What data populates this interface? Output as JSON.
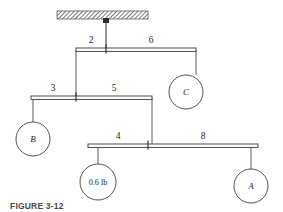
{
  "figure": {
    "caption": "FIGURE 3-12",
    "colors": {
      "line": "#4a4a4a",
      "bar_stroke": "#3a3a3a",
      "text": "#262626",
      "hatch": "#555555",
      "background": "#ffffff"
    }
  },
  "ceiling": {
    "name": "hatched-ceiling-support",
    "anchor_label": "",
    "x": 57,
    "y": 11,
    "width": 91,
    "height": 8,
    "anchor_x": 106
  },
  "bars": [
    {
      "id": "bar-1",
      "y": 48,
      "x_left": 76,
      "x_right": 196,
      "pivot_x": 106,
      "left_label": "2",
      "right_label": "6",
      "left_label_x": 91,
      "right_label_x": 151,
      "label_y": 42
    },
    {
      "id": "bar-2",
      "y": 96,
      "x_left": 31,
      "x_right": 152,
      "pivot_x": 76,
      "left_label": "3",
      "right_label": "5",
      "left_label_x": 53,
      "right_label_x": 114,
      "label_y": 90
    },
    {
      "id": "bar-3",
      "y": 144,
      "x_left": 88,
      "x_right": 258,
      "pivot_x": 148,
      "left_label": "4",
      "right_label": "8",
      "left_label_x": 118,
      "right_label_x": 203,
      "label_y": 138
    }
  ],
  "weights": [
    {
      "id": "weight-c",
      "label": "C",
      "italic": true,
      "cx": 186,
      "cy": 92,
      "r": 17
    },
    {
      "id": "weight-b",
      "label": "B",
      "italic": true,
      "cx": 33,
      "cy": 139,
      "r": 17
    },
    {
      "id": "weight-load",
      "label": "0.6 lb",
      "italic": false,
      "cx": 98,
      "cy": 182,
      "r": 18
    },
    {
      "id": "weight-a",
      "label": "A",
      "italic": true,
      "cx": 251,
      "cy": 186,
      "r": 17
    }
  ]
}
